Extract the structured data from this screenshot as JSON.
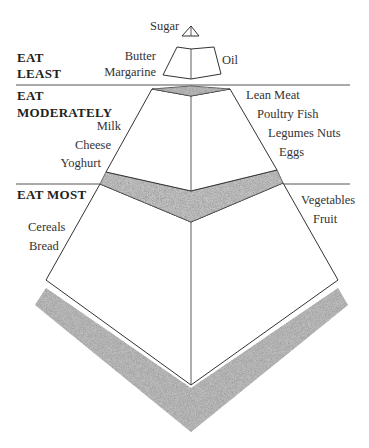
{
  "tiers": [
    {
      "id": "least",
      "heading_lines": [
        "EAT",
        "LEAST"
      ],
      "left_items": [
        "Butter",
        "Margarine"
      ],
      "right_items": [
        "Oil"
      ],
      "top_item": "Sugar"
    },
    {
      "id": "moderately",
      "heading_lines": [
        "EAT",
        "MODERATELY"
      ],
      "left_items": [
        "Milk",
        "Cheese",
        "Yoghurt"
      ],
      "right_items": [
        "Lean Meat",
        "Poultry Fish",
        "Legumes Nuts",
        "Eggs"
      ]
    },
    {
      "id": "most",
      "heading_lines": [
        "EAT MOST"
      ],
      "left_items": [
        "Cereals",
        "Bread"
      ],
      "right_items": [
        "Vegetables",
        "Fruit"
      ]
    }
  ],
  "colors": {
    "line": "#333333",
    "stipple": "#9a9a9a",
    "background": "#ffffff"
  }
}
